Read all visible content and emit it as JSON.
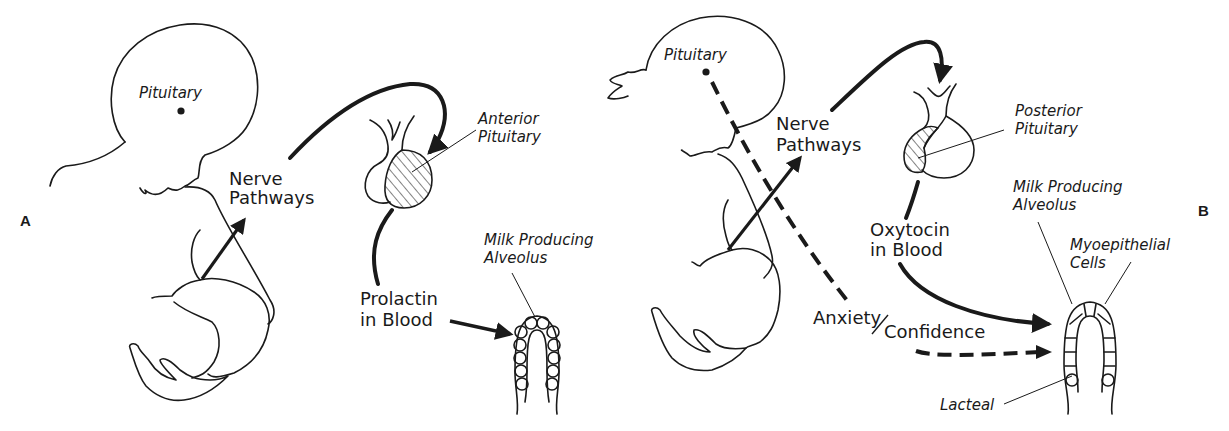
{
  "figure": {
    "panels": [
      {
        "id": "A",
        "letter": "A",
        "labels": {
          "pituitary": "Pituitary",
          "nerve_line1": "Nerve",
          "nerve_line2": "Pathways",
          "gland_line1": "Anterior",
          "gland_line2": "Pituitary",
          "hormone_line1": "Prolactin",
          "hormone_line2": "in Blood",
          "alveolus_line1": "Milk Producing",
          "alveolus_line2": "Alveolus"
        }
      },
      {
        "id": "B",
        "letter": "B",
        "labels": {
          "pituitary": "Pituitary",
          "nerve_line1": "Nerve",
          "nerve_line2": "Pathways",
          "gland_line1": "Posterior",
          "gland_line2": "Pituitary",
          "hormone_line1": "Oxytocin",
          "hormone_line2": "in Blood",
          "alveolus_line1": "Milk Producing",
          "alveolus_line2": "Alveolus",
          "myo_line1": "Myoepithelial",
          "myo_line2": "Cells",
          "anxiety": "Anxiety",
          "confidence": "Confidence",
          "lacteal": "Lacteal"
        }
      }
    ],
    "colors": {
      "ink": "#1a1a1a",
      "background": "#ffffff"
    }
  }
}
